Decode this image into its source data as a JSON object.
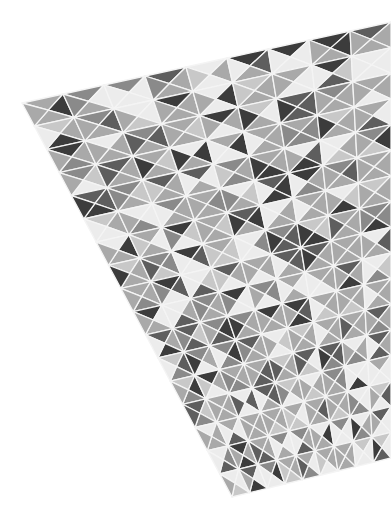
{
  "image": {
    "description": "Grayscale geometric tiled surface photographed in perspective; triangular tiles separated by white grout lines",
    "background": "#ffffff",
    "grout_color": "#f4f4f4",
    "corners": {
      "top_left": [
        22,
        103
      ],
      "top_right": [
        391,
        22
      ],
      "bottom_right": [
        391,
        458
      ],
      "bottom_left": [
        232,
        497
      ]
    },
    "grid": {
      "cols": 9,
      "rows": 17
    },
    "palette": {
      "light": "#ececec",
      "mid_light": "#c8c8c8",
      "mid": "#a9a9a9",
      "mid_dark": "#8a8a8a",
      "dark": "#5e5e5e",
      "darkest": "#3c3c3c"
    }
  }
}
